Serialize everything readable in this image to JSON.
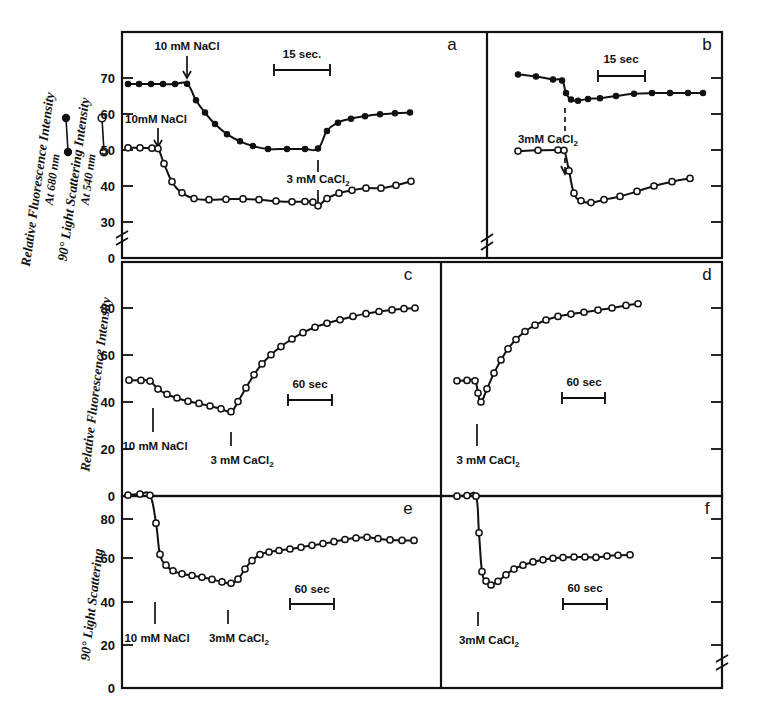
{
  "figure": {
    "background_color": "#ffffff",
    "ink_color": "#111111"
  },
  "axis_titles": {
    "fluorescence_680": "Relative Fluorescence Intensity",
    "fluorescence_680_sub": "At 680 nm",
    "scattering_540": "90° Light Scattering Intensity",
    "scattering_540_sub": "At 540 nm",
    "fluorescence_plain": "Relative Fluorescence Intensity",
    "scattering_plain": "90° Light Scattering"
  },
  "legend": {
    "filled_symbol_name": "filled-circle-marker",
    "open_symbol_name": "open-circle-marker"
  },
  "panel_letters": [
    "a",
    "b",
    "c",
    "d",
    "e",
    "f"
  ],
  "annotations": {
    "nacl": "10 mM NaCl",
    "nacl_tight": "10mM NaCl",
    "cacl2": "3 mM CaCl",
    "cacl2_tight": "3mM CaCl",
    "cacl2_sub": "2",
    "scale_15sec_dot": "15 sec.",
    "scale_15sec": "15 sec",
    "scale_60sec": "60 sec"
  },
  "chart_data": [
    {
      "id": "panel-a",
      "type": "line",
      "title": "a",
      "xlabel": "",
      "ylabel": "Relative Fluorescence Intensity At 680 nm / 90° Light Scattering Intensity At 540 nm",
      "ylim": [
        28,
        74
      ],
      "yticks": [
        30,
        40,
        50,
        60,
        70
      ],
      "y_break_below": 30,
      "y_zero_label": "0",
      "grid": false,
      "scale_bar": {
        "label": "15 sec.",
        "x_start": 274,
        "x_end": 330
      },
      "events": [
        {
          "label": "10 mM NaCl",
          "series": "fluorescence",
          "x": 187
        },
        {
          "label": "10mM NaCl",
          "series": "scattering",
          "x": 158
        },
        {
          "label": "3 mM CaCl2",
          "series": "both",
          "x": 318
        }
      ],
      "series": [
        {
          "name": "Relative Fluorescence Intensity At 680 nm",
          "marker": "filled-circle",
          "points": [
            [
              128,
              68.3
            ],
            [
              139,
              68.3
            ],
            [
              151,
              68.3
            ],
            [
              163,
              68.3
            ],
            [
              175,
              68.3
            ],
            [
              187,
              68.4
            ],
            [
              196,
              63.8
            ],
            [
              205,
              60.4
            ],
            [
              215,
              57.2
            ],
            [
              227,
              54.4
            ],
            [
              240,
              52.4
            ],
            [
              253,
              51.1
            ],
            [
              268,
              50.3
            ],
            [
              287,
              50.3
            ],
            [
              305,
              50.3
            ],
            [
              318,
              50.4
            ],
            [
              327,
              55.3
            ],
            [
              338,
              57.6
            ],
            [
              351,
              58.7
            ],
            [
              365,
              59.4
            ],
            [
              380,
              59.9
            ],
            [
              395,
              60.2
            ],
            [
              410,
              60.4
            ]
          ]
        },
        {
          "name": "90° Light Scattering Intensity At 540 nm",
          "marker": "open-circle",
          "points": [
            [
              128,
              50.6
            ],
            [
              140,
              50.6
            ],
            [
              152,
              50.5
            ],
            [
              158,
              50.4
            ],
            [
              164,
              46.2
            ],
            [
              172,
              41.2
            ],
            [
              182,
              38.1
            ],
            [
              194,
              36.5
            ],
            [
              209,
              36.2
            ],
            [
              226,
              36.3
            ],
            [
              243,
              36.4
            ],
            [
              259,
              36.2
            ],
            [
              276,
              35.8
            ],
            [
              292,
              35.6
            ],
            [
              305,
              35.7
            ],
            [
              313,
              35.5
            ],
            [
              318,
              34.5
            ],
            [
              327,
              36.5
            ],
            [
              339,
              38.0
            ],
            [
              352,
              38.8
            ],
            [
              366,
              39.4
            ],
            [
              381,
              39.4
            ],
            [
              396,
              40.2
            ],
            [
              411,
              41.3
            ]
          ]
        }
      ]
    },
    {
      "id": "panel-b",
      "type": "line",
      "title": "b",
      "xlabel": "",
      "ylabel": "",
      "ylim": [
        28,
        74
      ],
      "yticks": [
        30,
        40,
        50,
        60,
        70
      ],
      "grid": false,
      "scale_bar": {
        "label": "15 sec",
        "x_start": 598,
        "x_end": 645
      },
      "events": [
        {
          "label": "3mM CaCl2",
          "series": "both",
          "x": 565
        }
      ],
      "series": [
        {
          "name": "Relative Fluorescence Intensity At 680 nm",
          "marker": "filled-circle",
          "points": [
            [
              518,
              71.0
            ],
            [
              536,
              70.4
            ],
            [
              553,
              69.6
            ],
            [
              562,
              69.3
            ],
            [
              566,
              65.8
            ],
            [
              571,
              64.0
            ],
            [
              578,
              63.7
            ],
            [
              588,
              64.2
            ],
            [
              600,
              64.4
            ],
            [
              616,
              65.0
            ],
            [
              634,
              65.6
            ],
            [
              652,
              65.8
            ],
            [
              670,
              65.8
            ],
            [
              688,
              65.8
            ],
            [
              703,
              65.8
            ]
          ]
        },
        {
          "name": "90° Light Scattering Intensity At 540 nm",
          "marker": "open-circle",
          "points": [
            [
              518,
              49.7
            ],
            [
              538,
              49.9
            ],
            [
              558,
              50.0
            ],
            [
              564,
              49.9
            ],
            [
              569,
              44.2
            ],
            [
              574,
              38.0
            ],
            [
              581,
              35.9
            ],
            [
              591,
              35.4
            ],
            [
              604,
              36.2
            ],
            [
              620,
              37.1
            ],
            [
              637,
              38.5
            ],
            [
              654,
              40.0
            ],
            [
              672,
              41.2
            ],
            [
              690,
              42.1
            ]
          ]
        }
      ]
    },
    {
      "id": "panel-c",
      "type": "line",
      "title": "c",
      "xlabel": "",
      "ylabel": "Relative Fluorescence Intensity",
      "ylim": [
        0,
        92
      ],
      "yticks": [
        0,
        20,
        40,
        60,
        80
      ],
      "grid": false,
      "scale_bar": {
        "label": "60 sec",
        "x_start": 288,
        "x_end": 332
      },
      "events": [
        {
          "label": "10 mM NaCl",
          "x": 153
        },
        {
          "label": "3 mM CaCl2",
          "x": 231
        }
      ],
      "series": [
        {
          "name": "Relative Fluorescence Intensity",
          "marker": "open-circle",
          "points": [
            [
              129,
              49.3
            ],
            [
              141,
              49.2
            ],
            [
              150,
              48.9
            ],
            [
              158,
              45.5
            ],
            [
              167,
              43.3
            ],
            [
              177,
              41.7
            ],
            [
              188,
              40.3
            ],
            [
              199,
              39.4
            ],
            [
              210,
              38.3
            ],
            [
              221,
              37.1
            ],
            [
              231,
              35.9
            ],
            [
              238,
              40.2
            ],
            [
              246,
              46.0
            ],
            [
              254,
              51.6
            ],
            [
              262,
              56.2
            ],
            [
              271,
              60.1
            ],
            [
              281,
              63.6
            ],
            [
              292,
              66.8
            ],
            [
              303,
              69.5
            ],
            [
              315,
              71.8
            ],
            [
              327,
              73.5
            ],
            [
              340,
              75.0
            ],
            [
              353,
              76.4
            ],
            [
              366,
              77.6
            ],
            [
              379,
              78.5
            ],
            [
              392,
              79.2
            ],
            [
              404,
              79.7
            ],
            [
              415,
              80.0
            ]
          ]
        }
      ]
    },
    {
      "id": "panel-d",
      "type": "line",
      "title": "d",
      "xlabel": "",
      "ylabel": "",
      "ylim": [
        0,
        92
      ],
      "yticks": [
        0,
        20,
        40,
        60,
        80
      ],
      "grid": false,
      "scale_bar": {
        "label": "60 sec",
        "x_start": 562,
        "x_end": 605
      },
      "events": [
        {
          "label": "3 mM CaCl2",
          "x": 477
        }
      ],
      "series": [
        {
          "name": "Relative Fluorescence Intensity",
          "marker": "open-circle",
          "points": [
            [
              457,
              49.0
            ],
            [
              467,
              49.2
            ],
            [
              475,
              49.0
            ],
            [
              478,
              43.8
            ],
            [
              481,
              40.0
            ],
            [
              487,
              45.6
            ],
            [
              494,
              52.3
            ],
            [
              501,
              57.9
            ],
            [
              508,
              62.6
            ],
            [
              516,
              66.6
            ],
            [
              525,
              70.0
            ],
            [
              535,
              72.7
            ],
            [
              546,
              74.9
            ],
            [
              558,
              76.4
            ],
            [
              571,
              77.4
            ],
            [
              584,
              78.2
            ],
            [
              598,
              79.1
            ],
            [
              612,
              80.0
            ],
            [
              626,
              81.1
            ],
            [
              638,
              81.8
            ]
          ]
        }
      ]
    },
    {
      "id": "panel-e",
      "type": "line",
      "title": "e",
      "xlabel": "",
      "ylabel": "90° Light Scattering",
      "ylim": [
        0,
        96
      ],
      "yticks": [
        0,
        20,
        40,
        60,
        80
      ],
      "grid": false,
      "scale_bar": {
        "label": "60 sec",
        "x_start": 290,
        "x_end": 334
      },
      "events": [
        {
          "label": "10 mM NaCl",
          "x": 155
        },
        {
          "label": "3mM CaCl2",
          "x": 228
        }
      ],
      "series": [
        {
          "name": "90° Light Scattering",
          "marker": "open-circle",
          "points": [
            [
              128,
              89.5
            ],
            [
              140,
              90.0
            ],
            [
              150,
              89.4
            ],
            [
              156,
              76.5
            ],
            [
              160,
              62.0
            ],
            [
              166,
              57.0
            ],
            [
              173,
              54.4
            ],
            [
              182,
              53.0
            ],
            [
              192,
              52.2
            ],
            [
              202,
              51.4
            ],
            [
              212,
              50.4
            ],
            [
              222,
              49.2
            ],
            [
              231,
              48.6
            ],
            [
              238,
              50.5
            ],
            [
              245,
              55.2
            ],
            [
              252,
              59.1
            ],
            [
              260,
              61.9
            ],
            [
              269,
              63.1
            ],
            [
              279,
              63.8
            ],
            [
              290,
              64.5
            ],
            [
              301,
              65.3
            ],
            [
              312,
              66.2
            ],
            [
              323,
              67.0
            ],
            [
              334,
              67.9
            ],
            [
              345,
              68.9
            ],
            [
              356,
              69.6
            ],
            [
              367,
              69.9
            ],
            [
              378,
              69.3
            ],
            [
              390,
              68.7
            ],
            [
              402,
              68.5
            ],
            [
              414,
              68.5
            ]
          ]
        }
      ]
    },
    {
      "id": "panel-f",
      "type": "line",
      "title": "f",
      "xlabel": "",
      "ylabel": "",
      "ylim": [
        0,
        96
      ],
      "yticks": [
        0,
        20,
        40,
        60,
        80
      ],
      "grid": false,
      "scale_bar": {
        "label": "60 sec",
        "x_start": 563,
        "x_end": 607
      },
      "events": [
        {
          "label": "3mM CaCl2",
          "x": 478
        }
      ],
      "series": [
        {
          "name": "90° Light Scattering",
          "marker": "open-circle",
          "points": [
            [
              457,
              89.0
            ],
            [
              467,
              89.3
            ],
            [
              476,
              89.0
            ],
            [
              479,
              72.0
            ],
            [
              482,
              54.0
            ],
            [
              486,
              49.6
            ],
            [
              491,
              47.8
            ],
            [
              498,
              49.5
            ],
            [
              506,
              52.5
            ],
            [
              514,
              55.2
            ],
            [
              523,
              57.0
            ],
            [
              533,
              58.5
            ],
            [
              543,
              59.5
            ],
            [
              553,
              60.2
            ],
            [
              563,
              60.5
            ],
            [
              574,
              60.8
            ],
            [
              585,
              60.8
            ],
            [
              596,
              60.6
            ],
            [
              607,
              61.2
            ],
            [
              618,
              61.6
            ],
            [
              630,
              61.8
            ]
          ]
        }
      ]
    }
  ]
}
